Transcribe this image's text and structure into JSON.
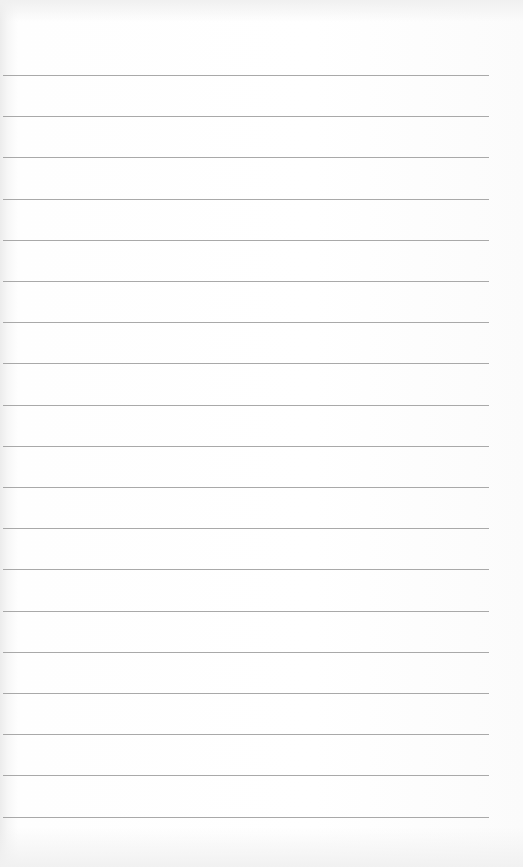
{
  "page": {
    "type": "lined-paper",
    "background_color": "#fdfdfd",
    "line_color": "#9a9a9a",
    "line_count": 19,
    "first_line_y": 75,
    "line_spacing": 41.2,
    "line_left": 3,
    "line_width": 486
  }
}
